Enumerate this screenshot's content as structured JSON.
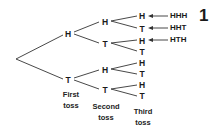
{
  "figure_number": "1",
  "nodes": {
    "first": [
      "H",
      "T"
    ],
    "second": [
      "H",
      "T",
      "H",
      "T"
    ],
    "third": [
      "H",
      "T",
      "H",
      "T",
      "H",
      "T",
      "H",
      "T"
    ]
  },
  "outcomes": [
    "HHH",
    "HHT",
    "HTH"
  ],
  "labels": {
    "first": [
      "First",
      "toss"
    ],
    "second": [
      "Second",
      "toss"
    ],
    "third": [
      "Third",
      "toss"
    ]
  },
  "colors": {
    "ink": "#1a1a1a",
    "background": "#ffffff"
  }
}
